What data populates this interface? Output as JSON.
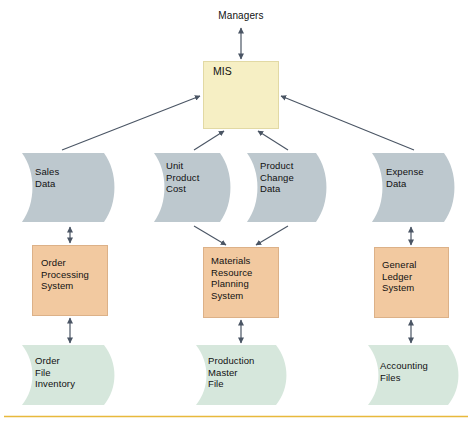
{
  "diagram": {
    "title": "Managers",
    "top_actor": {
      "label": "Managers"
    },
    "central_system": {
      "label": "MIS"
    },
    "colors": {
      "mis_fill": "#F6EFC4",
      "mis_stroke": "#D8CF96",
      "datastore_fill": "#BDC8CE",
      "process_fill": "#F2C9A0",
      "process_stroke": "#D7A87A",
      "file_fill": "#D6E7DC",
      "arrow": "#4A5564",
      "bottom_rule": "#E8B93C",
      "text": "#111111",
      "background": "#FFFFFF"
    },
    "data_stores": [
      {
        "label": "Sales\nData"
      },
      {
        "label": "Unit\nProduct\nCost"
      },
      {
        "label": "Product\nChange\nData"
      },
      {
        "label": "Expense\nData"
      }
    ],
    "processes": [
      {
        "label": "Order\nProcessing\nSystem"
      },
      {
        "label": "Materials\nResource\nPlanning\nSystem"
      },
      {
        "label": "General\nLedger\nSystem"
      }
    ],
    "files": [
      {
        "label": "Order\nFile\nInventory"
      },
      {
        "label": "Production\nMaster\nFile"
      },
      {
        "label": "Accounting\nFiles"
      }
    ],
    "connections": [
      {
        "from": "Managers",
        "to": "MIS",
        "direction": "bidirectional"
      },
      {
        "from": "Sales Data",
        "to": "MIS",
        "direction": "up"
      },
      {
        "from": "Unit Product Cost",
        "to": "MIS",
        "direction": "up"
      },
      {
        "from": "Product Change Data",
        "to": "MIS",
        "direction": "up"
      },
      {
        "from": "Expense Data",
        "to": "MIS",
        "direction": "up"
      },
      {
        "from": "Sales Data",
        "to": "Order Processing System",
        "direction": "bidirectional"
      },
      {
        "from": "Unit Product Cost",
        "to": "Materials Resource Planning System",
        "direction": "down"
      },
      {
        "from": "Product Change Data",
        "to": "Materials Resource Planning System",
        "direction": "down"
      },
      {
        "from": "Expense Data",
        "to": "General Ledger System",
        "direction": "bidirectional"
      },
      {
        "from": "Order Processing System",
        "to": "Order File Inventory",
        "direction": "bidirectional"
      },
      {
        "from": "Materials Resource Planning System",
        "to": "Production Master File",
        "direction": "bidirectional"
      },
      {
        "from": "General Ledger System",
        "to": "Accounting Files",
        "direction": "bidirectional"
      }
    ]
  }
}
